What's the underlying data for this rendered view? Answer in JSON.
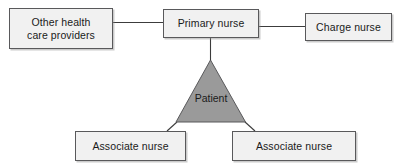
{
  "diagram": {
    "colors": {
      "box_fill": "#f1f1f1",
      "box_border": "#59595b",
      "triangle_fill": "#9a9a9a",
      "triangle_border": "#59595b",
      "connector_line": "#3c3c3c",
      "text": "#1a1a1a",
      "background": "#ffffff"
    },
    "nodes": {
      "other_providers": {
        "label": "Other health\ncare providers",
        "shape": "rectangle"
      },
      "primary_nurse": {
        "label": "Primary nurse",
        "shape": "rectangle"
      },
      "charge_nurse": {
        "label": "Charge nurse",
        "shape": "rectangle"
      },
      "patient": {
        "label": "Patient",
        "shape": "triangle"
      },
      "associate_nurse_left": {
        "label": "Associate nurse",
        "shape": "rectangle"
      },
      "associate_nurse_right": {
        "label": "Associate nurse",
        "shape": "rectangle"
      }
    },
    "connectors": [
      {
        "name": "other-providers-to-primary-nurse",
        "from": "other_providers",
        "to": "primary_nurse",
        "style": "straight-horizontal"
      },
      {
        "name": "primary-nurse-to-charge-nurse",
        "from": "primary_nurse",
        "to": "charge_nurse",
        "style": "straight-horizontal"
      },
      {
        "name": "primary-nurse-to-patient",
        "from": "primary_nurse",
        "to": "patient",
        "style": "straight-vertical"
      },
      {
        "name": "patient-to-associate-nurse-left",
        "from": "patient",
        "to": "associate_nurse_left",
        "style": "diagonal"
      },
      {
        "name": "patient-to-associate-nurse-right",
        "from": "patient",
        "to": "associate_nurse_right",
        "style": "diagonal"
      }
    ]
  }
}
